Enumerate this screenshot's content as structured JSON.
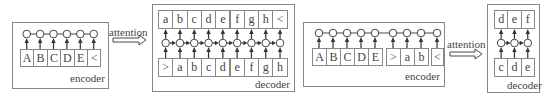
{
  "colors": {
    "stroke": "#888888",
    "node": "#ffffff",
    "arrow": "#333333",
    "text": "#444444"
  },
  "attention_labels": [
    {
      "text": "attention",
      "x": 109,
      "y": 26,
      "arrow": {
        "x": 113,
        "y": 36,
        "w": 33,
        "h": 8
      }
    },
    {
      "text": "attention",
      "x": 447,
      "y": 38,
      "arrow": {
        "x": 450,
        "y": 50,
        "w": 32,
        "h": 8
      }
    }
  ],
  "panels": [
    {
      "id": "encoder-1",
      "label": "encoder",
      "type": "encoder",
      "box": {
        "x": 12,
        "y": 22,
        "w": 97,
        "h": 67
      },
      "label_pos": {
        "x": 70,
        "y": 72
      },
      "cell_y": 49,
      "cell_h": 18,
      "node_y": 34,
      "cells": [
        {
          "t": "A",
          "x": 20,
          "w": 13.4
        },
        {
          "t": "B",
          "x": 33.4,
          "w": 13.4
        },
        {
          "t": "C",
          "x": 46.8,
          "w": 13.4
        },
        {
          "t": "D",
          "x": 60.2,
          "w": 13.4
        },
        {
          "t": "E",
          "x": 73.6,
          "w": 13.4
        },
        {
          "t": "<",
          "x": 87,
          "w": 13.4
        }
      ]
    },
    {
      "id": "decoder-1",
      "label": "decoder",
      "type": "decoder",
      "box": {
        "x": 152,
        "y": 4,
        "w": 143,
        "h": 88
      },
      "label_pos": {
        "x": 255,
        "y": 78
      },
      "top_y": 10,
      "bottom_y": 58,
      "cell_h": 19,
      "node_y": 43,
      "top_cells": [
        "a",
        "b",
        "c",
        "d",
        "e",
        "f",
        "g",
        "h",
        "<"
      ],
      "bottom_cells": [
        ">",
        "a",
        "b",
        "c",
        "d",
        "e",
        "f",
        "g",
        "h"
      ],
      "cells_x": 158,
      "cell_w": 14.3
    },
    {
      "id": "encoder-2",
      "label": "encoder",
      "type": "encoder",
      "box": {
        "x": 303,
        "y": 22,
        "w": 142,
        "h": 65
      },
      "label_pos": {
        "x": 405,
        "y": 70
      },
      "cell_y": 48,
      "cell_h": 18,
      "node_y": 33,
      "cells": [
        {
          "t": "A",
          "x": 312,
          "w": 14
        },
        {
          "t": "B",
          "x": 326,
          "w": 14
        },
        {
          "t": "C",
          "x": 340,
          "w": 14
        },
        {
          "t": "D",
          "x": 354,
          "w": 14
        },
        {
          "t": "E",
          "x": 368,
          "w": 14
        },
        {
          "t": ">",
          "x": 386,
          "w": 14
        },
        {
          "t": "a",
          "x": 400,
          "w": 14
        },
        {
          "t": "b",
          "x": 414,
          "w": 14
        },
        {
          "t": "<",
          "x": 431,
          "w": 12
        }
      ]
    },
    {
      "id": "decoder-2",
      "label": "decoder",
      "type": "decoder",
      "box": {
        "x": 487,
        "y": 4,
        "w": 53,
        "h": 89
      },
      "label_pos": {
        "x": 507,
        "y": 79
      },
      "top_y": 10,
      "bottom_y": 58,
      "cell_h": 19,
      "node_y": 43,
      "top_cells": [
        "d",
        "e",
        "f"
      ],
      "bottom_cells": [
        "c",
        "d",
        "e"
      ],
      "cells_x": 494,
      "cell_w": 13.3
    }
  ]
}
